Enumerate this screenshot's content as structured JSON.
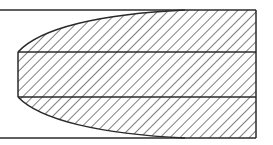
{
  "diagram": {
    "type": "hatched-cross-section",
    "colors": {
      "stroke": "#2a2a2a",
      "hatch": "#3a3a3a",
      "background": "#ffffff"
    },
    "outer_bounds": {
      "left": 0,
      "top": 10,
      "right": 256,
      "bottom": 138
    },
    "core_band": {
      "left": 18,
      "top": 52,
      "bottom": 97
    },
    "curve_meets_edge_x": 185,
    "hatch_spacing": 7
  }
}
